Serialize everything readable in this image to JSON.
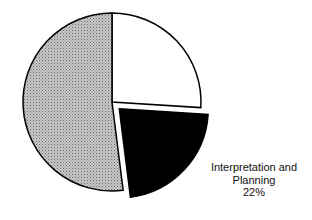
{
  "chart_data": {
    "type": "pie",
    "title": "",
    "slices": [
      {
        "name": "",
        "value": 26,
        "fill": "#ffffff",
        "exploded": false
      },
      {
        "name": "Interpretation and Planning",
        "value": 22,
        "fill": "#000000",
        "exploded": true
      },
      {
        "name": "",
        "value": 52,
        "fill": "#b8b8b8",
        "exploded": false
      }
    ],
    "annotations": [
      {
        "text_line1": "Interpretation and",
        "text_line2": "Planning",
        "text_line3": "22%"
      }
    ],
    "legend": "none"
  }
}
